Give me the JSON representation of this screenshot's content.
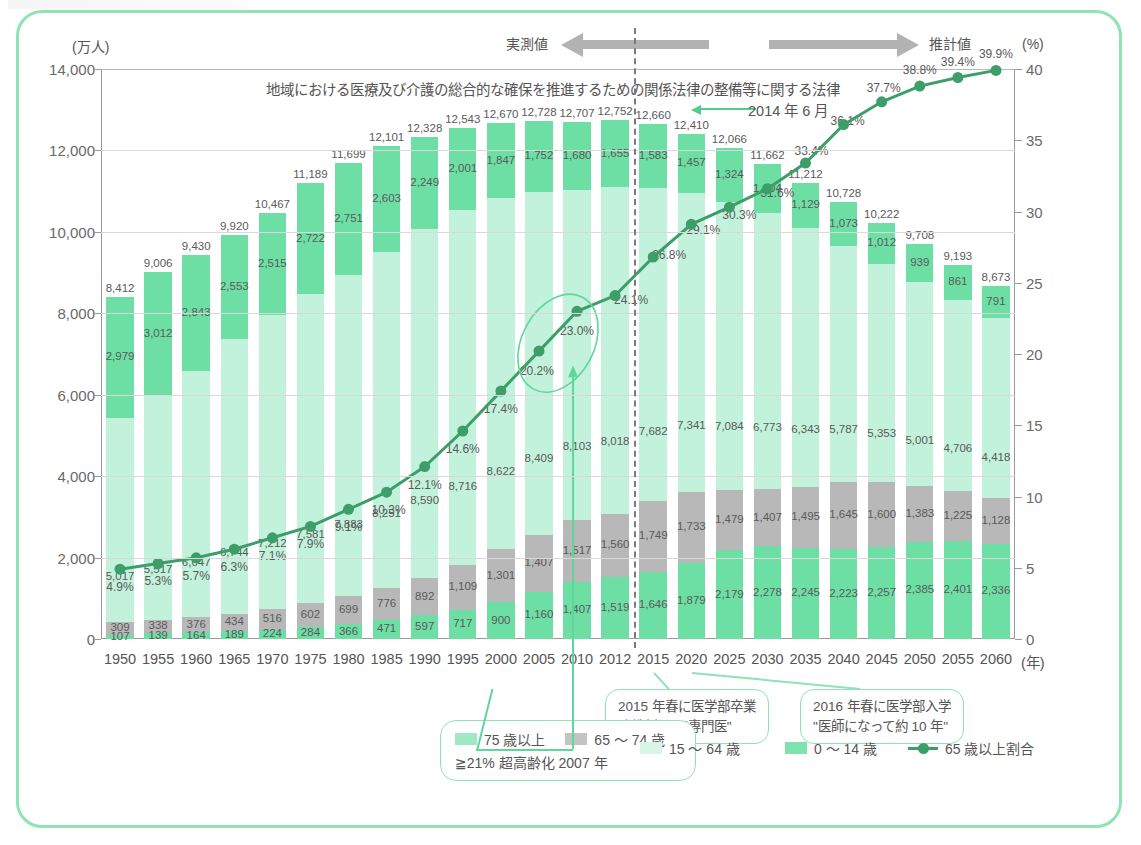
{
  "axes": {
    "left_unit": "(万人)",
    "right_unit": "(%)",
    "left_ticks": [
      "14,000",
      "12,000",
      "10,000",
      "8,000",
      "6,000",
      "4,000",
      "2,000",
      "0"
    ],
    "right_ticks": [
      "40",
      "35",
      "30",
      "25",
      "20",
      "15",
      "10",
      "5",
      "0"
    ],
    "x_unit": "(年)"
  },
  "band": {
    "actual_label": "実測値",
    "projection_label": "推計値"
  },
  "annotations": {
    "law_title": "地域における医療及び介護の総合的な確保を推進するための関係法律の整備等に関する法律",
    "law_date": "2014 年 6 月",
    "callout_2015": "2015 年春に医学部卒業\n\"新制度にて専門医\"",
    "callout_2015_line1": "2015 年春に医学部卒業",
    "callout_2015_line2": "\"新制度にて専門医\"",
    "callout_2016_line1": "2016 年春に医学部入学",
    "callout_2016_line2": "\"医師になって約 10 年\"",
    "legend_note": "≧21% 超高齢化 2007 年"
  },
  "legend": [
    {
      "label": "75 歳以上",
      "color": "#6ddfa4",
      "type": "swatch"
    },
    {
      "label": "65 ～ 74 歳",
      "color": "#b8b8b8",
      "type": "swatch"
    },
    {
      "label": "15 ～ 64 歳",
      "color": "#c2f1dc",
      "type": "swatch"
    },
    {
      "label": "0 ～ 14 歳",
      "color": "#6ddfa4",
      "type": "swatch"
    },
    {
      "label": "65 歳以上割合",
      "color": "#3d9e6a",
      "type": "line"
    }
  ],
  "colors": {
    "frame": "#8fe3b4",
    "age75": "#6ddfa4",
    "age6574": "#b8b8b8",
    "age1564": "#c2f1dc",
    "age014": "#6ddfa4",
    "ratio_line": "#3d9e6a",
    "divider": "#7b7b7b"
  },
  "chart_data": {
    "type": "bar",
    "title": "",
    "xlabel": "(年)",
    "ylabel": "(万人)",
    "ylim": [
      0,
      14000
    ],
    "y2lim": [
      0,
      40
    ],
    "y2label": "(%)",
    "grid": true,
    "legend_position": "bottom",
    "categories": [
      "1950",
      "1955",
      "1960",
      "1965",
      "1970",
      "1975",
      "1980",
      "1985",
      "1990",
      "1995",
      "2000",
      "2005",
      "2010",
      "2012",
      "2015",
      "2020",
      "2025",
      "2030",
      "2035",
      "2040",
      "2045",
      "2050",
      "2055",
      "2060"
    ],
    "actual_until": "2012",
    "series": [
      {
        "name": "75 歳以上",
        "key": "age75",
        "values": [
          107,
          139,
          164,
          189,
          224,
          284,
          366,
          471,
          597,
          717,
          900,
          1160,
          1407,
          1519,
          1646,
          1879,
          2179,
          2278,
          2245,
          2223,
          2257,
          2385,
          2401,
          2336
        ]
      },
      {
        "name": "65 ～ 74 歳",
        "key": "age6574",
        "values": [
          309,
          338,
          376,
          434,
          516,
          602,
          699,
          776,
          892,
          1109,
          1301,
          1407,
          1517,
          1560,
          1749,
          1733,
          1479,
          1407,
          1495,
          1645,
          1600,
          1383,
          1225,
          1128
        ]
      },
      {
        "name": "15 ～ 64 歳",
        "key": "age1564",
        "values": [
          5017,
          5517,
          6047,
          6744,
          7212,
          7581,
          7883,
          8251,
          8590,
          8716,
          8622,
          8409,
          8103,
          8018,
          7682,
          7341,
          7084,
          6773,
          6343,
          5787,
          5353,
          5001,
          4706,
          4418
        ]
      },
      {
        "name": "0 ～ 14 歳",
        "key": "age014",
        "values": [
          2979,
          3012,
          2843,
          2553,
          2515,
          2722,
          2751,
          2603,
          2249,
          2001,
          1847,
          1752,
          1680,
          1655,
          1583,
          1457,
          1324,
          1204,
          1129,
          1073,
          1012,
          939,
          861,
          791
        ]
      }
    ],
    "totals": [
      "8,412",
      "9,006",
      "9,430",
      "9,920",
      "10,467",
      "11,189",
      "11,699",
      "12,101",
      "12,328",
      "12,543",
      "12,670",
      "12,728",
      "12,707",
      "12,752",
      "12,660",
      "12,410",
      "12,066",
      "11,662",
      "11,212",
      "10,728",
      "10,222",
      "9,708",
      "9,193",
      "8,673"
    ],
    "ratio_series": {
      "name": "65 歳以上割合",
      "unit": "%",
      "values": [
        4.9,
        5.3,
        5.7,
        6.3,
        7.1,
        7.9,
        9.1,
        10.3,
        12.1,
        14.6,
        17.4,
        20.2,
        23.0,
        24.1,
        26.8,
        29.1,
        30.3,
        31.6,
        33.4,
        36.1,
        37.7,
        38.8,
        39.4,
        39.9
      ],
      "labels": [
        "4.9%",
        "5.3%",
        "5.7%",
        "6.3%",
        "7.1%",
        "7.9%",
        "9.1%",
        "10.3%",
        "12.1%",
        "14.6%",
        "17.4%",
        "20.2%",
        "23.0%",
        "24.1%",
        "26.8%",
        "29.1%",
        "30.3%",
        "31.6%",
        "33.4%",
        "36.1%",
        "37.7%",
        "38.8%",
        "39.4%",
        "39.9%"
      ],
      "highlighted": [
        "20.2%",
        "23.0%"
      ]
    },
    "age75_labels": [
      "107",
      "139",
      "164",
      "189",
      "224",
      "284",
      "366",
      "471",
      "597",
      "717",
      "900",
      "1,160",
      "1,407",
      "1,519",
      "1,646",
      "1,879",
      "2,179",
      "2,278",
      "2,245",
      "2,223",
      "2,257",
      "2,385",
      "2,401",
      "2,336"
    ],
    "age6574_labels": [
      "309",
      "338",
      "376",
      "434",
      "516",
      "602",
      "699",
      "776",
      "892",
      "1,109",
      "1,301",
      "1,407",
      "1,517",
      "1,560",
      "1,749",
      "1,733",
      "1,479",
      "1,407",
      "1,495",
      "1,645",
      "1,600",
      "1,383",
      "1,225",
      "1,128"
    ],
    "age1564_labels": [
      "5,017",
      "5,517",
      "6,047",
      "6,744",
      "7,212",
      "7,581",
      "7,883",
      "8,251",
      "8,590",
      "8,716",
      "8,622",
      "8,409",
      "8,103",
      "8,018",
      "7,682",
      "7,341",
      "7,084",
      "6,773",
      "6,343",
      "5,787",
      "5,353",
      "5,001",
      "4,706",
      "4,418"
    ],
    "age014_labels": [
      "2,979",
      "3,012",
      "2,843",
      "2,553",
      "2,515",
      "2,722",
      "2,751",
      "2,603",
      "2,249",
      "2,001",
      "1,847",
      "1,752",
      "1,680",
      "1,655",
      "1,583",
      "1,457",
      "1,324",
      "1,204",
      "1,129",
      "1,073",
      "1,012",
      "939",
      "861",
      "791"
    ]
  }
}
